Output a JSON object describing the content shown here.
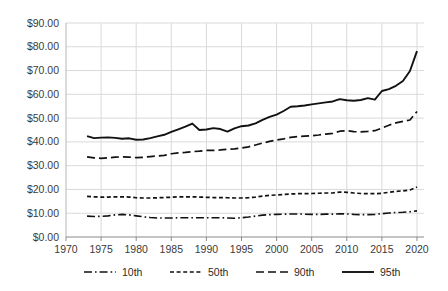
{
  "chart_data": {
    "type": "line",
    "title": "",
    "xlabel": "",
    "ylabel": "",
    "xlim": [
      1970,
      2021
    ],
    "ylim": [
      0,
      90
    ],
    "grid": true,
    "legend_position": "bottom",
    "y_tick_labels": [
      "$0.00",
      "$10.00",
      "$20.00",
      "$30.00",
      "$40.00",
      "$50.00",
      "$60.00",
      "$70.00",
      "$80.00",
      "$90.00"
    ],
    "y_tick_values": [
      0,
      10,
      20,
      30,
      40,
      50,
      60,
      70,
      80,
      90
    ],
    "x_tick_labels": [
      "1970",
      "1975",
      "1980",
      "1985",
      "1990",
      "1995",
      "2000",
      "2005",
      "2010",
      "2015",
      "2020"
    ],
    "x_tick_values": [
      1970,
      1975,
      1980,
      1985,
      1990,
      1995,
      2000,
      2005,
      2010,
      2015,
      2020
    ],
    "x": [
      1973,
      1974,
      1975,
      1976,
      1977,
      1978,
      1979,
      1980,
      1981,
      1982,
      1983,
      1984,
      1985,
      1986,
      1987,
      1988,
      1989,
      1990,
      1991,
      1992,
      1993,
      1994,
      1995,
      1996,
      1997,
      1998,
      1999,
      2000,
      2001,
      2002,
      2003,
      2004,
      2005,
      2006,
      2007,
      2008,
      2009,
      2010,
      2011,
      2012,
      2013,
      2014,
      2015,
      2016,
      2017,
      2018,
      2019,
      2020
    ],
    "series": [
      {
        "name": "10th",
        "dash": "dash-dot",
        "values": [
          8.8,
          8.6,
          8.7,
          8.9,
          9.3,
          9.5,
          9.3,
          8.9,
          8.5,
          8.2,
          8.0,
          8.0,
          8.0,
          8.1,
          8.1,
          8.1,
          8.1,
          8.1,
          8.1,
          8.1,
          8.0,
          7.9,
          8.1,
          8.4,
          8.8,
          9.2,
          9.4,
          9.5,
          9.6,
          9.7,
          9.7,
          9.6,
          9.5,
          9.5,
          9.6,
          9.6,
          9.8,
          9.7,
          9.5,
          9.4,
          9.4,
          9.5,
          9.8,
          10.1,
          10.3,
          10.4,
          10.6,
          11.0
        ]
      },
      {
        "name": "50th",
        "dash": "fine-dash",
        "values": [
          17.1,
          16.9,
          16.8,
          16.8,
          16.9,
          16.9,
          16.8,
          16.5,
          16.4,
          16.4,
          16.5,
          16.6,
          16.7,
          16.9,
          16.9,
          16.9,
          16.8,
          16.7,
          16.6,
          16.6,
          16.5,
          16.4,
          16.4,
          16.5,
          16.8,
          17.2,
          17.5,
          17.7,
          17.9,
          18.1,
          18.2,
          18.2,
          18.3,
          18.4,
          18.5,
          18.5,
          18.9,
          18.8,
          18.5,
          18.3,
          18.2,
          18.2,
          18.4,
          18.8,
          19.2,
          19.4,
          19.8,
          21.0
        ]
      },
      {
        "name": "90th",
        "dash": "long-dash",
        "values": [
          33.7,
          33.3,
          33.1,
          33.3,
          33.6,
          33.7,
          33.6,
          33.4,
          33.5,
          33.8,
          34.1,
          34.3,
          35.0,
          35.4,
          35.6,
          35.9,
          36.1,
          36.4,
          36.4,
          36.6,
          36.9,
          37.1,
          37.4,
          37.9,
          38.7,
          39.5,
          40.2,
          40.8,
          41.3,
          41.9,
          42.2,
          42.4,
          42.6,
          42.9,
          43.3,
          43.6,
          44.5,
          44.7,
          44.3,
          44.2,
          44.4,
          44.7,
          45.8,
          47.0,
          48.0,
          48.6,
          49.2,
          52.8
        ]
      },
      {
        "name": "95th",
        "dash": "solid",
        "values": [
          42.4,
          41.6,
          41.8,
          41.9,
          41.7,
          41.3,
          41.5,
          40.9,
          41.0,
          41.6,
          42.3,
          43.0,
          44.2,
          45.3,
          46.4,
          47.7,
          45.0,
          45.2,
          45.8,
          45.4,
          44.3,
          45.7,
          46.6,
          46.9,
          47.8,
          49.3,
          50.5,
          51.5,
          53.0,
          54.8,
          55.0,
          55.3,
          55.8,
          56.2,
          56.6,
          57.0,
          58.0,
          57.5,
          57.3,
          57.6,
          58.4,
          57.8,
          61.4,
          62.2,
          63.6,
          65.6,
          69.8,
          78.2
        ]
      }
    ]
  },
  "legend": {
    "items": [
      {
        "label": "10th"
      },
      {
        "label": "50th"
      },
      {
        "label": "90th"
      },
      {
        "label": "95th"
      }
    ]
  }
}
